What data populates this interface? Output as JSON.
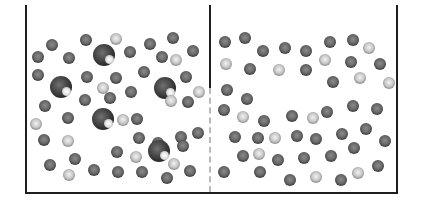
{
  "diagram": {
    "colors": {
      "wall": "#1e1e1e",
      "dashed_divider": "#b9b9b9",
      "background": "#ffffff"
    },
    "container": {
      "left": 25,
      "top": 5,
      "right": 397,
      "bottom": 193,
      "wall_width": 2
    },
    "divider": {
      "x": 210,
      "solid_top": 5,
      "solid_bottom": 88,
      "dashed_bottom": 192
    },
    "legend_counts": {
      "left_large": 5,
      "right_large": 0
    },
    "particles": [
      {
        "x": 52,
        "y": 45,
        "r": 6,
        "type": "medium"
      },
      {
        "x": 38,
        "y": 57,
        "r": 6,
        "type": "medium"
      },
      {
        "x": 69,
        "y": 58,
        "r": 6,
        "type": "medium"
      },
      {
        "x": 86,
        "y": 40,
        "r": 6,
        "type": "medium"
      },
      {
        "x": 116,
        "y": 39,
        "r": 6,
        "type": "small"
      },
      {
        "x": 130,
        "y": 52,
        "r": 6,
        "type": "medium"
      },
      {
        "x": 150,
        "y": 44,
        "r": 6,
        "type": "medium"
      },
      {
        "x": 173,
        "y": 38,
        "r": 6,
        "type": "medium"
      },
      {
        "x": 162,
        "y": 57,
        "r": 6,
        "type": "medium"
      },
      {
        "x": 176,
        "y": 60,
        "r": 6,
        "type": "small"
      },
      {
        "x": 193,
        "y": 51,
        "r": 6,
        "type": "medium"
      },
      {
        "x": 104,
        "y": 55,
        "r": 11,
        "type": "large"
      },
      {
        "x": 38,
        "y": 75,
        "r": 6,
        "type": "medium"
      },
      {
        "x": 61,
        "y": 87,
        "r": 11,
        "type": "large"
      },
      {
        "x": 87,
        "y": 77,
        "r": 6,
        "type": "medium"
      },
      {
        "x": 116,
        "y": 78,
        "r": 6,
        "type": "medium"
      },
      {
        "x": 103,
        "y": 88,
        "r": 6,
        "type": "small"
      },
      {
        "x": 144,
        "y": 72,
        "r": 6,
        "type": "medium"
      },
      {
        "x": 165,
        "y": 88,
        "r": 11,
        "type": "large"
      },
      {
        "x": 186,
        "y": 77,
        "r": 6,
        "type": "medium"
      },
      {
        "x": 199,
        "y": 92,
        "r": 6,
        "type": "small"
      },
      {
        "x": 45,
        "y": 106,
        "r": 6,
        "type": "medium"
      },
      {
        "x": 85,
        "y": 100,
        "r": 6,
        "type": "medium"
      },
      {
        "x": 110,
        "y": 98,
        "r": 6,
        "type": "medium"
      },
      {
        "x": 131,
        "y": 92,
        "r": 6,
        "type": "medium"
      },
      {
        "x": 171,
        "y": 101,
        "r": 6,
        "type": "small"
      },
      {
        "x": 188,
        "y": 102,
        "r": 6,
        "type": "medium"
      },
      {
        "x": 36,
        "y": 124,
        "r": 6,
        "type": "small"
      },
      {
        "x": 68,
        "y": 118,
        "r": 6,
        "type": "medium"
      },
      {
        "x": 103,
        "y": 119,
        "r": 11,
        "type": "large"
      },
      {
        "x": 123,
        "y": 120,
        "r": 6,
        "type": "small"
      },
      {
        "x": 137,
        "y": 119,
        "r": 6,
        "type": "medium"
      },
      {
        "x": 44,
        "y": 140,
        "r": 6,
        "type": "medium"
      },
      {
        "x": 68,
        "y": 141,
        "r": 6,
        "type": "small"
      },
      {
        "x": 139,
        "y": 138,
        "r": 6,
        "type": "medium"
      },
      {
        "x": 158,
        "y": 143,
        "r": 6,
        "type": "medium"
      },
      {
        "x": 181,
        "y": 137,
        "r": 6,
        "type": "medium"
      },
      {
        "x": 198,
        "y": 133,
        "r": 6,
        "type": "medium"
      },
      {
        "x": 117,
        "y": 152,
        "r": 6,
        "type": "medium"
      },
      {
        "x": 136,
        "y": 157,
        "r": 6,
        "type": "small"
      },
      {
        "x": 159,
        "y": 151,
        "r": 11,
        "type": "large"
      },
      {
        "x": 183,
        "y": 146,
        "r": 6,
        "type": "medium"
      },
      {
        "x": 75,
        "y": 159,
        "r": 6,
        "type": "medium"
      },
      {
        "x": 50,
        "y": 165,
        "r": 6,
        "type": "medium"
      },
      {
        "x": 94,
        "y": 170,
        "r": 6,
        "type": "medium"
      },
      {
        "x": 118,
        "y": 172,
        "r": 6,
        "type": "medium"
      },
      {
        "x": 142,
        "y": 172,
        "r": 6,
        "type": "medium"
      },
      {
        "x": 174,
        "y": 164,
        "r": 6,
        "type": "small"
      },
      {
        "x": 190,
        "y": 171,
        "r": 6,
        "type": "medium"
      },
      {
        "x": 69,
        "y": 175,
        "r": 6,
        "type": "small"
      },
      {
        "x": 167,
        "y": 178,
        "r": 6,
        "type": "medium"
      },
      {
        "x": 225,
        "y": 42,
        "r": 6,
        "type": "medium"
      },
      {
        "x": 245,
        "y": 38,
        "r": 6,
        "type": "medium"
      },
      {
        "x": 263,
        "y": 51,
        "r": 6,
        "type": "medium"
      },
      {
        "x": 285,
        "y": 48,
        "r": 6,
        "type": "medium"
      },
      {
        "x": 306,
        "y": 51,
        "r": 6,
        "type": "medium"
      },
      {
        "x": 330,
        "y": 42,
        "r": 6,
        "type": "medium"
      },
      {
        "x": 353,
        "y": 40,
        "r": 6,
        "type": "medium"
      },
      {
        "x": 369,
        "y": 48,
        "r": 6,
        "type": "small"
      },
      {
        "x": 226,
        "y": 64,
        "r": 6,
        "type": "small"
      },
      {
        "x": 250,
        "y": 69,
        "r": 6,
        "type": "medium"
      },
      {
        "x": 279,
        "y": 70,
        "r": 6,
        "type": "small"
      },
      {
        "x": 306,
        "y": 70,
        "r": 6,
        "type": "medium"
      },
      {
        "x": 325,
        "y": 60,
        "r": 6,
        "type": "small"
      },
      {
        "x": 351,
        "y": 62,
        "r": 6,
        "type": "medium"
      },
      {
        "x": 380,
        "y": 64,
        "r": 6,
        "type": "medium"
      },
      {
        "x": 227,
        "y": 90,
        "r": 6,
        "type": "medium"
      },
      {
        "x": 247,
        "y": 99,
        "r": 6,
        "type": "medium"
      },
      {
        "x": 333,
        "y": 82,
        "r": 6,
        "type": "medium"
      },
      {
        "x": 360,
        "y": 78,
        "r": 6,
        "type": "small"
      },
      {
        "x": 389,
        "y": 83,
        "r": 6,
        "type": "small"
      },
      {
        "x": 224,
        "y": 110,
        "r": 6,
        "type": "medium"
      },
      {
        "x": 243,
        "y": 117,
        "r": 6,
        "type": "small"
      },
      {
        "x": 264,
        "y": 121,
        "r": 6,
        "type": "medium"
      },
      {
        "x": 292,
        "y": 116,
        "r": 6,
        "type": "medium"
      },
      {
        "x": 313,
        "y": 118,
        "r": 6,
        "type": "small"
      },
      {
        "x": 327,
        "y": 112,
        "r": 6,
        "type": "medium"
      },
      {
        "x": 353,
        "y": 106,
        "r": 6,
        "type": "medium"
      },
      {
        "x": 377,
        "y": 109,
        "r": 6,
        "type": "medium"
      },
      {
        "x": 235,
        "y": 137,
        "r": 6,
        "type": "medium"
      },
      {
        "x": 258,
        "y": 138,
        "r": 6,
        "type": "medium"
      },
      {
        "x": 275,
        "y": 138,
        "r": 6,
        "type": "small"
      },
      {
        "x": 297,
        "y": 136,
        "r": 6,
        "type": "medium"
      },
      {
        "x": 316,
        "y": 139,
        "r": 6,
        "type": "medium"
      },
      {
        "x": 342,
        "y": 134,
        "r": 6,
        "type": "medium"
      },
      {
        "x": 366,
        "y": 129,
        "r": 6,
        "type": "medium"
      },
      {
        "x": 385,
        "y": 141,
        "r": 6,
        "type": "medium"
      },
      {
        "x": 243,
        "y": 156,
        "r": 6,
        "type": "medium"
      },
      {
        "x": 259,
        "y": 154,
        "r": 6,
        "type": "small"
      },
      {
        "x": 278,
        "y": 160,
        "r": 6,
        "type": "medium"
      },
      {
        "x": 304,
        "y": 158,
        "r": 6,
        "type": "medium"
      },
      {
        "x": 331,
        "y": 156,
        "r": 6,
        "type": "medium"
      },
      {
        "x": 354,
        "y": 148,
        "r": 6,
        "type": "medium"
      },
      {
        "x": 224,
        "y": 172,
        "r": 6,
        "type": "medium"
      },
      {
        "x": 260,
        "y": 172,
        "r": 6,
        "type": "medium"
      },
      {
        "x": 290,
        "y": 180,
        "r": 6,
        "type": "medium"
      },
      {
        "x": 316,
        "y": 177,
        "r": 6,
        "type": "small"
      },
      {
        "x": 341,
        "y": 180,
        "r": 6,
        "type": "medium"
      },
      {
        "x": 358,
        "y": 173,
        "r": 6,
        "type": "small"
      },
      {
        "x": 378,
        "y": 166,
        "r": 6,
        "type": "medium"
      }
    ]
  }
}
